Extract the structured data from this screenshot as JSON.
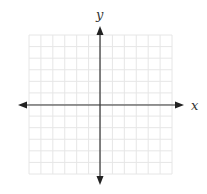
{
  "diagram": {
    "type": "coordinate-plane",
    "x_axis_label": "x",
    "y_axis_label": "y",
    "grid": {
      "columns": 12,
      "rows": 12,
      "color": "#e6e6e6"
    },
    "axis_color": "#333333",
    "arrows": [
      "left",
      "right",
      "up",
      "down"
    ]
  }
}
